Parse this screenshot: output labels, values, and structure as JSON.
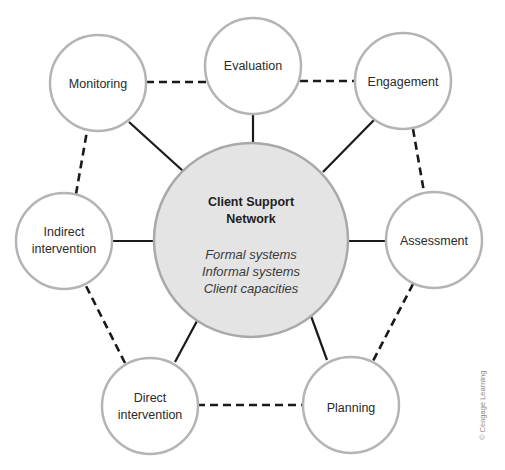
{
  "diagram": {
    "title": "Client Support Network",
    "center": {
      "title_lines": [
        "Client Support",
        "Network"
      ],
      "items": [
        "Formal systems",
        "Informal systems",
        "Client capacities"
      ],
      "fill": "#e4e4e4",
      "stroke": "#a9a9a9"
    },
    "nodes": [
      {
        "id": "evaluation",
        "lines": [
          "Evaluation"
        ]
      },
      {
        "id": "engagement",
        "lines": [
          "Engagement"
        ]
      },
      {
        "id": "assessment",
        "lines": [
          "Assessment"
        ]
      },
      {
        "id": "planning",
        "lines": [
          "Planning"
        ]
      },
      {
        "id": "direct-intervention",
        "lines": [
          "Direct",
          "intervention"
        ]
      },
      {
        "id": "indirect-intervention",
        "lines": [
          "Indirect",
          "intervention"
        ]
      },
      {
        "id": "monitoring",
        "lines": [
          "Monitoring"
        ]
      }
    ],
    "edges": {
      "solid": "center to each outer node",
      "dashed": "between adjacent outer nodes forming a cycle"
    },
    "credit": "© Cengage Learning"
  }
}
